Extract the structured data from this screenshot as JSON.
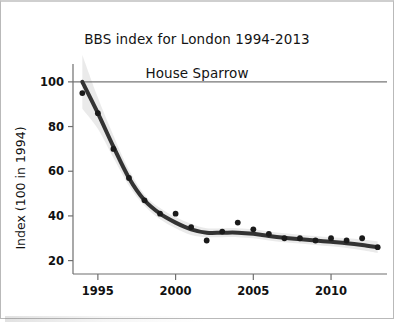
{
  "figure": {
    "title_line_1": "BBS index for London 1994-2013",
    "title_line_2": "House Sparrow",
    "background_color": "#ffffff",
    "border_color": "#b9b9b9"
  },
  "chart_data": {
    "type": "line",
    "title": "BBS index for London 1994-2013 House Sparrow",
    "subtitle": "House Sparrow",
    "xlabel": "",
    "ylabel": "Index (100 in 1994)",
    "xlim": [
      1993.4,
      2013.6
    ],
    "ylim": [
      14,
      108
    ],
    "grid": false,
    "reference_line": {
      "axis": "y",
      "value": 100,
      "color": "#777777",
      "label": "100"
    },
    "legend": null,
    "x_tick_labels": [
      "1995",
      "2000",
      "2005",
      "2010"
    ],
    "x_ticks": [
      1995,
      2000,
      2005,
      2010
    ],
    "y_tick_labels": [
      "20",
      "40",
      "60",
      "80",
      "100"
    ],
    "y_ticks": [
      20,
      40,
      60,
      80,
      100
    ],
    "x": [
      1994,
      1995,
      1996,
      1997,
      1998,
      1999,
      2000,
      2001,
      2002,
      2003,
      2004,
      2005,
      2006,
      2007,
      2008,
      2009,
      2010,
      2011,
      2012,
      2013
    ],
    "series": [
      {
        "name": "Annual index (points)",
        "type": "scatter",
        "marker_color": "#1a1a1a",
        "values": [
          95,
          86,
          70,
          57,
          47,
          41,
          41,
          35,
          29,
          33,
          37,
          34,
          32,
          30,
          30,
          29,
          30,
          29,
          30,
          26
        ]
      },
      {
        "name": "Smoothed trend",
        "type": "line",
        "line_color": "#333333",
        "line_width": 4,
        "values": [
          100,
          86,
          71,
          57,
          47,
          41,
          37,
          34,
          32.5,
          32.5,
          32.5,
          32,
          31,
          30.2,
          29.6,
          29,
          28.4,
          27.8,
          27,
          26
        ]
      }
    ],
    "confidence_band": {
      "name": "Confidence interval",
      "fill_color": "#d8d8d8",
      "opacity": 0.55,
      "lower": [
        88,
        79,
        66,
        53.5,
        44.5,
        38.5,
        34.5,
        31.5,
        30.5,
        30.5,
        30.5,
        30,
        29,
        28.2,
        27.6,
        27,
        26.4,
        25.6,
        24.6,
        23.4
      ],
      "upper": [
        112,
        93,
        76,
        60.5,
        49.5,
        43.5,
        39.5,
        36.5,
        34.5,
        34.5,
        34.5,
        34,
        33,
        32.2,
        31.6,
        31,
        30.4,
        30,
        29.4,
        28.6
      ]
    }
  }
}
